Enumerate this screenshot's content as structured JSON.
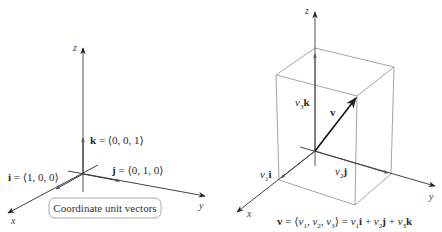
{
  "left_figure": {
    "axes": {
      "x": "x",
      "y": "y",
      "z": "z"
    },
    "vectors": [
      {
        "name": "i",
        "components": "⟨1, 0, 0⟩"
      },
      {
        "name": "j",
        "components": "⟨0, 1, 0⟩"
      },
      {
        "name": "k",
        "components": "⟨0, 0, 1⟩"
      }
    ],
    "caption": "Coordinate unit vectors",
    "labels": {
      "i_label": "i",
      "i_eq": " = ⟨1, 0, 0⟩",
      "j_label": "j",
      "j_eq": " = ⟨0, 1, 0⟩",
      "k_label": "k",
      "k_eq": " = ⟨0, 0, 1⟩"
    }
  },
  "right_figure": {
    "axes": {
      "x": "x",
      "y": "y",
      "z": "z"
    },
    "labels": {
      "v": "v",
      "v1": "v",
      "v1_sub": "1",
      "i": "i",
      "v2": "v",
      "v2_sub": "2",
      "j": "j",
      "v3": "v",
      "v3_sub": "3",
      "k": "k"
    },
    "formula": {
      "v": "v",
      "eq1": " = ⟨",
      "c1": "v",
      "c1_sub": "1",
      "sep1": ", ",
      "c2": "v",
      "c2_sub": "2",
      "sep2": ", ",
      "c3": "v",
      "c3_sub": "3",
      "eq2": "⟩ = ",
      "t1": "v",
      "t1_sub": "1",
      "t1_vec": "i",
      "plus1": " + ",
      "t2": "v",
      "t2_sub": "2",
      "t2_vec": "j",
      "plus2": " + ",
      "t3": "v",
      "t3_sub": "3",
      "t3_vec": "k"
    }
  },
  "colors": {
    "axis": "#333333",
    "box": "#9a9a9a",
    "vector": "#111111"
  }
}
